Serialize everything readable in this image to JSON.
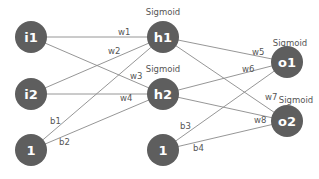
{
  "diagram": {
    "type": "neural-network",
    "nodes": {
      "i1": {
        "label": "i1"
      },
      "i2": {
        "label": "i2"
      },
      "b_in": {
        "label": "1"
      },
      "h1": {
        "label": "h1",
        "activation": "Sigmoid"
      },
      "h2": {
        "label": "h2",
        "activation": "Sigmoid"
      },
      "b_hid": {
        "label": "1"
      },
      "o1": {
        "label": "o1",
        "activation": "Sigmoid"
      },
      "o2": {
        "label": "o2",
        "activation": "Sigmoid"
      }
    },
    "edges": {
      "w1": {
        "label": "w1",
        "from": "i1",
        "to": "h1"
      },
      "w2": {
        "label": "w2",
        "from": "i2",
        "to": "h1"
      },
      "w3": {
        "label": "w3",
        "from": "i1",
        "to": "h2"
      },
      "w4": {
        "label": "w4",
        "from": "i2",
        "to": "h2"
      },
      "b1": {
        "label": "b1",
        "from": "b_in",
        "to": "h1"
      },
      "b2": {
        "label": "b2",
        "from": "b_in",
        "to": "h2"
      },
      "w5": {
        "label": "w5",
        "from": "h1",
        "to": "o1"
      },
      "w6": {
        "label": "w6",
        "from": "h2",
        "to": "o1"
      },
      "w7": {
        "label": "w7",
        "from": "h1",
        "to": "o2"
      },
      "w8": {
        "label": "w8",
        "from": "h2",
        "to": "o2"
      },
      "b3": {
        "label": "b3",
        "from": "b_hid",
        "to": "o1"
      },
      "b4": {
        "label": "b4",
        "from": "b_hid",
        "to": "o2"
      }
    },
    "colors": {
      "node": "#5e5e5e",
      "edge": "#8a8a8a",
      "text": "#555555"
    }
  }
}
